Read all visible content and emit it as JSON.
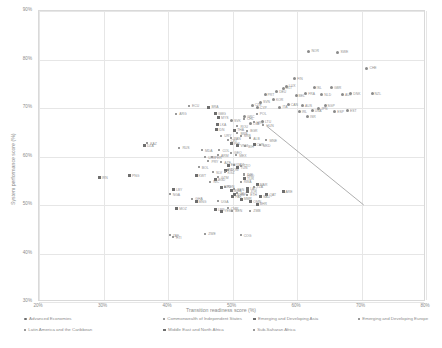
{
  "chart_data": {
    "type": "scatter",
    "title": "",
    "xlabel": "Transition readiness score (%)",
    "ylabel": "System performance score (%)",
    "xlim": [
      20,
      80
    ],
    "ylim": [
      30,
      90
    ],
    "xticks": [
      "20%",
      "30%",
      "40%",
      "50%",
      "60%",
      "70%",
      "80%"
    ],
    "yticks": [
      "30%",
      "40%",
      "50%",
      "60%",
      "70%",
      "80%",
      "90%"
    ],
    "grid": true,
    "legend_position": "bottom",
    "trendline": {
      "x0": 55.5,
      "y0": 66.0,
      "x1": 70.5,
      "y1": 49.8,
      "style": "solid"
    },
    "legend": [
      {
        "label": "Advanced Economies",
        "marker": "dot"
      },
      {
        "label": "Commonwealth of Independent States",
        "marker": "tick"
      },
      {
        "label": "Emerging and Developing Asia",
        "marker": "square"
      },
      {
        "label": "Emerging and Developing Europe",
        "marker": "tick"
      },
      {
        "label": "Latin America and the Caribbean",
        "marker": "tick"
      },
      {
        "label": "Middle East and North Africa",
        "marker": "square"
      },
      {
        "label": "Sub-Saharan Africa",
        "marker": "tick"
      }
    ],
    "series": [
      {
        "name": "Advanced Economies",
        "marker": "dot",
        "points": [
          {
            "label": "NOR",
            "x": 62.0,
            "y": 81.5
          },
          {
            "label": "SWE",
            "x": 66.5,
            "y": 81.3
          },
          {
            "label": "CHE",
            "x": 71.0,
            "y": 78.0
          },
          {
            "label": "FIN",
            "x": 59.8,
            "y": 75.8
          },
          {
            "label": "DNK",
            "x": 68.5,
            "y": 72.8
          },
          {
            "label": "AUT",
            "x": 67.2,
            "y": 72.6
          },
          {
            "label": "ISL",
            "x": 62.8,
            "y": 74.0
          },
          {
            "label": "LUX",
            "x": 58.5,
            "y": 74.3
          },
          {
            "label": "GBR",
            "x": 65.5,
            "y": 74.0
          },
          {
            "label": "NLD",
            "x": 64.0,
            "y": 72.6
          },
          {
            "label": "FRA",
            "x": 61.5,
            "y": 72.7
          },
          {
            "label": "NZL",
            "x": 71.8,
            "y": 72.8
          },
          {
            "label": "DEU",
            "x": 57.0,
            "y": 73.2
          },
          {
            "label": "BEL",
            "x": 60.0,
            "y": 72.4
          },
          {
            "label": "SGP",
            "x": 64.5,
            "y": 70.3
          },
          {
            "label": "USA",
            "x": 62.5,
            "y": 69.2
          },
          {
            "label": "ESP",
            "x": 66.0,
            "y": 69.0
          },
          {
            "label": "JPN",
            "x": 63.5,
            "y": 69.6
          },
          {
            "label": "IRL",
            "x": 60.5,
            "y": 69.0
          },
          {
            "label": "PRT",
            "x": 55.2,
            "y": 72.6
          },
          {
            "label": "ITA",
            "x": 57.5,
            "y": 70.0
          },
          {
            "label": "CAN",
            "x": 58.8,
            "y": 70.5
          },
          {
            "label": "AUS",
            "x": 61.0,
            "y": 70.3
          },
          {
            "label": "KOR",
            "x": 56.5,
            "y": 71.5
          },
          {
            "label": "CYP",
            "x": 54.0,
            "y": 69.8
          },
          {
            "label": "MLT",
            "x": 58.0,
            "y": 73.9
          },
          {
            "label": "SVN",
            "x": 54.5,
            "y": 71.0
          },
          {
            "label": "CZE",
            "x": 53.2,
            "y": 70.4
          },
          {
            "label": "EST",
            "x": 68.0,
            "y": 69.2
          },
          {
            "label": "ISR",
            "x": 61.8,
            "y": 68.0
          },
          {
            "label": "GRC",
            "x": 52.0,
            "y": 68.0
          },
          {
            "label": "SVK",
            "x": 50.0,
            "y": 67.2
          },
          {
            "label": "LVA",
            "x": 53.0,
            "y": 66.5
          },
          {
            "label": "LTU",
            "x": 54.8,
            "y": 67.0
          }
        ]
      },
      {
        "name": "Emerging and Developing Asia",
        "marker": "square",
        "points": [
          {
            "label": "BRA",
            "x": 46.5,
            "y": 70.0
          },
          {
            "label": "GMG",
            "x": 47.5,
            "y": 68.7
          },
          {
            "label": "MYS",
            "x": 48.0,
            "y": 67.8
          },
          {
            "label": "LKA",
            "x": 47.8,
            "y": 66.3
          },
          {
            "label": "IDN",
            "x": 47.6,
            "y": 65.4
          },
          {
            "label": "DZA",
            "x": 36.5,
            "y": 62.0
          },
          {
            "label": "PNG",
            "x": 34.2,
            "y": 55.8
          },
          {
            "label": "THA",
            "x": 50.5,
            "y": 65.2
          },
          {
            "label": "PHL",
            "x": 50.0,
            "y": 62.5
          },
          {
            "label": "VNM",
            "x": 51.0,
            "y": 62.0
          },
          {
            "label": "CHN",
            "x": 53.5,
            "y": 62.3
          },
          {
            "label": "IND",
            "x": 49.0,
            "y": 57.0
          },
          {
            "label": "BGD",
            "x": 47.5,
            "y": 55.0
          },
          {
            "label": "NPL",
            "x": 48.5,
            "y": 53.5
          },
          {
            "label": "KHM",
            "x": 50.5,
            "y": 52.0
          },
          {
            "label": "LAO",
            "x": 52.5,
            "y": 53.2
          },
          {
            "label": "MMR",
            "x": 51.5,
            "y": 51.0
          },
          {
            "label": "PAK",
            "x": 50.2,
            "y": 51.5
          },
          {
            "label": "MNG",
            "x": 44.5,
            "y": 50.5
          },
          {
            "label": "MOZ",
            "x": 41.5,
            "y": 49.0
          },
          {
            "label": "LBR",
            "x": 47.5,
            "y": 48.8
          },
          {
            "label": "BWA",
            "x": 50.0,
            "y": 52.8
          },
          {
            "label": "TUR",
            "x": 52.0,
            "y": 55.2
          }
        ]
      },
      {
        "name": "Commonwealth of Independent States",
        "marker": "tick",
        "points": [
          {
            "label": "KAZ",
            "x": 37.0,
            "y": 62.5
          },
          {
            "label": "RUS",
            "x": 42.0,
            "y": 61.5
          },
          {
            "label": "MDA",
            "x": 45.5,
            "y": 61.0
          },
          {
            "label": "GEO",
            "x": 50.0,
            "y": 60.5
          },
          {
            "label": "ARM",
            "x": 48.0,
            "y": 60.0
          },
          {
            "label": "AZE",
            "x": 48.5,
            "y": 58.5
          },
          {
            "label": "UKR",
            "x": 46.0,
            "y": 59.5
          },
          {
            "label": "KGZ",
            "x": 49.0,
            "y": 56.5
          },
          {
            "label": "TJK",
            "x": 52.0,
            "y": 56.0
          }
        ]
      },
      {
        "name": "Emerging and Developing Europe",
        "marker": "tick",
        "points": [
          {
            "label": "POL",
            "x": 54.0,
            "y": 68.5
          },
          {
            "label": "HRV",
            "x": 53.5,
            "y": 66.8
          },
          {
            "label": "HUN",
            "x": 55.0,
            "y": 66.2
          },
          {
            "label": "ROU",
            "x": 51.0,
            "y": 66.0
          },
          {
            "label": "BGR",
            "x": 52.5,
            "y": 65.0
          },
          {
            "label": "SRB",
            "x": 51.5,
            "y": 64.0
          },
          {
            "label": "ALB",
            "x": 53.0,
            "y": 63.5
          },
          {
            "label": "MKD",
            "x": 54.5,
            "y": 62.0
          },
          {
            "label": "BIH",
            "x": 52.2,
            "y": 61.8
          },
          {
            "label": "MNE",
            "x": 55.5,
            "y": 63.0
          }
        ]
      },
      {
        "name": "Latin America and the Caribbean",
        "marker": "tick",
        "points": [
          {
            "label": "URY",
            "x": 48.5,
            "y": 64.0
          },
          {
            "label": "CRI",
            "x": 49.5,
            "y": 63.0
          },
          {
            "label": "CHL",
            "x": 52.0,
            "y": 67.5
          },
          {
            "label": "ECU",
            "x": 43.5,
            "y": 70.2
          },
          {
            "label": "ARG",
            "x": 41.5,
            "y": 68.5
          },
          {
            "label": "COL",
            "x": 48.2,
            "y": 61.0
          },
          {
            "label": "MEX",
            "x": 50.8,
            "y": 60.0
          },
          {
            "label": "PER",
            "x": 47.0,
            "y": 59.5
          },
          {
            "label": "PRY",
            "x": 46.5,
            "y": 58.8
          },
          {
            "label": "BOL",
            "x": 45.0,
            "y": 57.5
          },
          {
            "label": "SLV",
            "x": 47.2,
            "y": 56.5
          },
          {
            "label": "GTM",
            "x": 48.0,
            "y": 55.5
          },
          {
            "label": "HND",
            "x": 52.0,
            "y": 55.8
          },
          {
            "label": "NIC",
            "x": 46.8,
            "y": 54.5
          },
          {
            "label": "DOM",
            "x": 49.5,
            "y": 57.0
          },
          {
            "label": "JAM",
            "x": 50.5,
            "y": 58.0
          },
          {
            "label": "TTO",
            "x": 51.5,
            "y": 57.8
          },
          {
            "label": "HTI",
            "x": 41.0,
            "y": 43.0
          },
          {
            "label": "PAN",
            "x": 50.0,
            "y": 63.5
          },
          {
            "label": "BRB",
            "x": 51.0,
            "y": 64.5
          }
        ]
      },
      {
        "name": "Middle East and North Africa",
        "marker": "square",
        "points": [
          {
            "label": "IRN",
            "x": 29.5,
            "y": 55.5
          },
          {
            "label": "LBY",
            "x": 41.0,
            "y": 53.0
          },
          {
            "label": "EGY",
            "x": 49.5,
            "y": 58.0
          },
          {
            "label": "MAR",
            "x": 54.0,
            "y": 54.0
          },
          {
            "label": "TUN",
            "x": 51.0,
            "y": 57.5
          },
          {
            "label": "JOR",
            "x": 52.5,
            "y": 52.5
          },
          {
            "label": "QAT",
            "x": 55.5,
            "y": 52.0
          },
          {
            "label": "ARE",
            "x": 58.0,
            "y": 52.5
          },
          {
            "label": "SAU",
            "x": 54.5,
            "y": 51.5
          },
          {
            "label": "KWT",
            "x": 44.5,
            "y": 55.8
          },
          {
            "label": "BHR",
            "x": 54.0,
            "y": 50.0
          },
          {
            "label": "OMN",
            "x": 53.0,
            "y": 50.5
          },
          {
            "label": "YEM",
            "x": 48.5,
            "y": 48.5
          }
        ]
      },
      {
        "name": "Sub-Saharan Africa",
        "marker": "tick",
        "points": [
          {
            "label": "NGA",
            "x": 40.5,
            "y": 52.0
          },
          {
            "label": "GHA",
            "x": 44.0,
            "y": 51.0
          },
          {
            "label": "KEN",
            "x": 49.0,
            "y": 53.5
          },
          {
            "label": "SEN",
            "x": 50.5,
            "y": 53.0
          },
          {
            "label": "ETH",
            "x": 52.5,
            "y": 51.8
          },
          {
            "label": "TZA",
            "x": 53.5,
            "y": 53.5
          },
          {
            "label": "ZMB",
            "x": 53.0,
            "y": 48.5
          },
          {
            "label": "ZAF",
            "x": 40.5,
            "y": 43.5
          },
          {
            "label": "ZWE",
            "x": 46.0,
            "y": 43.8
          },
          {
            "label": "COG",
            "x": 51.5,
            "y": 43.5
          },
          {
            "label": "CMR",
            "x": 49.5,
            "y": 49.0
          },
          {
            "label": "BEN",
            "x": 50.2,
            "y": 48.5
          },
          {
            "label": "MLI",
            "x": 51.0,
            "y": 52.2
          },
          {
            "label": "RWA",
            "x": 51.5,
            "y": 54.5
          },
          {
            "label": "UGA",
            "x": 48.0,
            "y": 50.5
          }
        ]
      }
    ]
  }
}
